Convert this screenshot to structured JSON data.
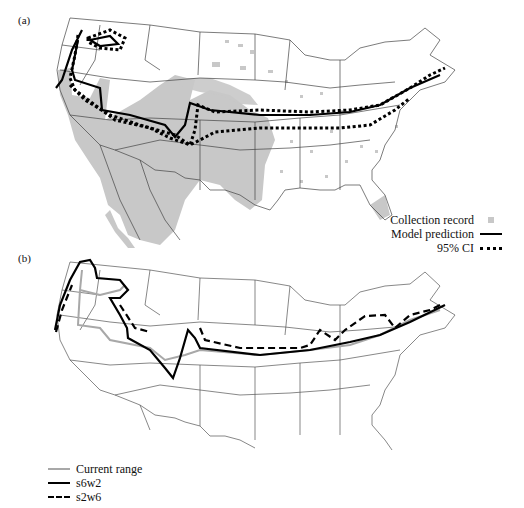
{
  "panel_a": {
    "label": "(a)",
    "legend": [
      {
        "label": "Collection record",
        "symbol": "gray-square"
      },
      {
        "label": "Model prediction",
        "symbol": "solid-line"
      },
      {
        "label": "95% CI",
        "symbol": "dotted-line"
      }
    ]
  },
  "panel_b": {
    "label": "(b)",
    "legend": [
      {
        "label": "Current range",
        "symbol": "gray-line"
      },
      {
        "label": "s6w2",
        "symbol": "solid-line"
      },
      {
        "label": "s2w6",
        "symbol": "dashed-line"
      }
    ]
  },
  "colors": {
    "collection_record": "#c8c8c8",
    "state_border": "#555555",
    "current_range": "#a8a8a8",
    "prediction": "#000000"
  }
}
